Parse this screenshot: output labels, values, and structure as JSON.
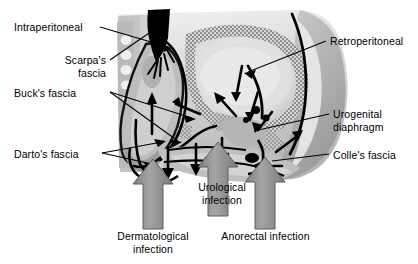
{
  "figure": {
    "width": 418,
    "height": 264,
    "background": "#ffffff",
    "ink": "#000000"
  },
  "labels": {
    "intraperitoneal": "Intraperitoneal",
    "scarpas_fascia": "Scarpa's\nfascia",
    "scarpas_line1": "Scarpa's",
    "scarpas_line2": "fascia",
    "bucks_fascia": "Buck's fascia",
    "dartos_fascia": "Darto's fascia",
    "retroperitoneal": "Retroperitoneal",
    "urogenital_diaphragm": "Urogenital\ndiaphragm",
    "urogenital_line1": "Urogenital",
    "urogenital_line2": "diaphragm",
    "colles_fascia": "Colle's fascia",
    "urological_infection": "Urological\ninfection",
    "urological_line1": "Urological",
    "urological_line2": "infection",
    "dermatological_infection": "Dermatological\ninfection",
    "dermatological_line1": "Dermatological",
    "dermatological_line2": "infection",
    "anorectal_infection": "Anorectal infection"
  },
  "colors": {
    "outline": "#000000",
    "skin_light": "#d9d9d9",
    "skin_mid": "#bfbfbf",
    "tissue_gray": "#a8a8a8",
    "muscle_dark": "#8c8c8c",
    "bone_stipple": "#9a9a9a",
    "cavity_pale": "#e8e8e8",
    "highlight_white": "#f4f4f4",
    "block_arrow": "#8f8f8f",
    "black_fill": "#000000"
  },
  "block_arrows": [
    {
      "name": "dermatological-infection-arrow",
      "x": 153,
      "y_tail": 228,
      "y_head": 160,
      "direction": "up"
    },
    {
      "name": "urological-infection-arrow",
      "x": 218,
      "y_tail": 215,
      "y_head": 143,
      "direction": "up"
    },
    {
      "name": "anorectal-infection-arrow",
      "x": 265,
      "y_tail": 228,
      "y_head": 158,
      "direction": "up"
    }
  ],
  "leader_lines": [
    {
      "name": "intraperitoneal-leader",
      "from": [
        100,
        27
      ],
      "to": [
        168,
        46
      ]
    },
    {
      "name": "scarpas-leader",
      "from": [
        110,
        60
      ],
      "to": [
        152,
        30
      ]
    },
    {
      "name": "bucks-leader-a",
      "from": [
        110,
        92
      ],
      "to": [
        190,
        118
      ]
    },
    {
      "name": "bucks-leader-b",
      "from": [
        110,
        92
      ],
      "to": [
        178,
        140
      ]
    },
    {
      "name": "dartos-leader-a",
      "from": [
        100,
        153
      ],
      "to": [
        160,
        143
      ]
    },
    {
      "name": "dartos-leader-b",
      "from": [
        100,
        153
      ],
      "to": [
        150,
        163
      ]
    },
    {
      "name": "retroperitoneal-leader",
      "from": [
        326,
        41
      ],
      "to": [
        250,
        72
      ]
    },
    {
      "name": "urogenital-leader",
      "from": [
        329,
        114
      ],
      "to": [
        255,
        130
      ]
    },
    {
      "name": "colles-leader",
      "from": [
        329,
        154
      ],
      "to": [
        272,
        160
      ]
    }
  ]
}
